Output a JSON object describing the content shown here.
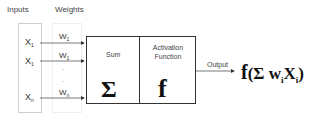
{
  "headers": {
    "inputs": "Inputs",
    "weights": "Weights"
  },
  "inputs": [
    {
      "base": "X",
      "sub": "1"
    },
    {
      "base": "X",
      "sub": "1"
    },
    {
      "base": "X",
      "sub": "n"
    }
  ],
  "weights": [
    {
      "base": "W",
      "sub": "1"
    },
    {
      "base": "W",
      "sub": "1"
    },
    {
      "base": "W",
      "sub": "n"
    }
  ],
  "ellipsis": [
    ".",
    "."
  ],
  "sum_block": {
    "label": "Sum",
    "symbol": "Σ"
  },
  "activation_block": {
    "label_line1": "Activation",
    "label_line2": "Function",
    "symbol": "f"
  },
  "output": {
    "label": "Output"
  },
  "formula": {
    "f": "f",
    "open": "(",
    "sigma": "Σ",
    "w": "w",
    "w_sub": "i",
    "x": "X",
    "x_sub": "i",
    "close": ")"
  }
}
